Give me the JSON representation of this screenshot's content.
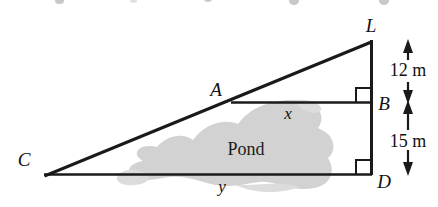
{
  "figure": {
    "type": "geometry-diagram",
    "background_color": "#ffffff",
    "line_color": "#1a1a1a",
    "pond_fill_color": "#d0d0d0",
    "vertices": [
      {
        "id": "L",
        "label": "L",
        "x": 372,
        "y": 41,
        "label_x": 374,
        "label_y": 31
      },
      {
        "id": "A",
        "label": "A",
        "x": 232,
        "y": 102,
        "label_x": 215,
        "label_y": 95
      },
      {
        "id": "B",
        "label": "B",
        "x": 371,
        "y": 102,
        "label_x": 377,
        "label_y": 110
      },
      {
        "id": "C",
        "label": "C",
        "x": 44,
        "y": 174,
        "label_x": 20,
        "label_y": 166
      },
      {
        "id": "D",
        "label": "D",
        "x": 371,
        "y": 174,
        "label_x": 377,
        "label_y": 186
      }
    ],
    "segments": [
      {
        "name": "CL-hypotenuse",
        "from": "C",
        "to": "L"
      },
      {
        "name": "LD-vertical",
        "from": "L",
        "to": "D"
      },
      {
        "name": "CD-base",
        "from": "C",
        "to": "D"
      },
      {
        "name": "AB-transversal",
        "from": "A",
        "to": "B"
      }
    ],
    "right_angles": [
      {
        "name": "right-angle-at-B",
        "x": 371,
        "y": 102,
        "size": 14
      },
      {
        "name": "right-angle-at-D",
        "x": 371,
        "y": 174,
        "size": 14
      }
    ],
    "side_labels": [
      {
        "name": "x",
        "text": "x",
        "x": 288,
        "y": 118
      },
      {
        "name": "y",
        "text": "y",
        "x": 222,
        "y": 190
      }
    ],
    "dimensions": [
      {
        "name": "dimension-LB",
        "text": "12 m",
        "from_y": 41,
        "to_y": 102,
        "arrow_x": 408,
        "label_x": 408,
        "label_y": 70
      },
      {
        "name": "dimension-BD",
        "text": "15 m",
        "from_y": 102,
        "to_y": 174,
        "arrow_x": 408,
        "label_x": 408,
        "label_y": 141
      }
    ],
    "region_label": {
      "name": "pond-label",
      "text": "Pond",
      "x": 246,
      "y": 150
    }
  }
}
